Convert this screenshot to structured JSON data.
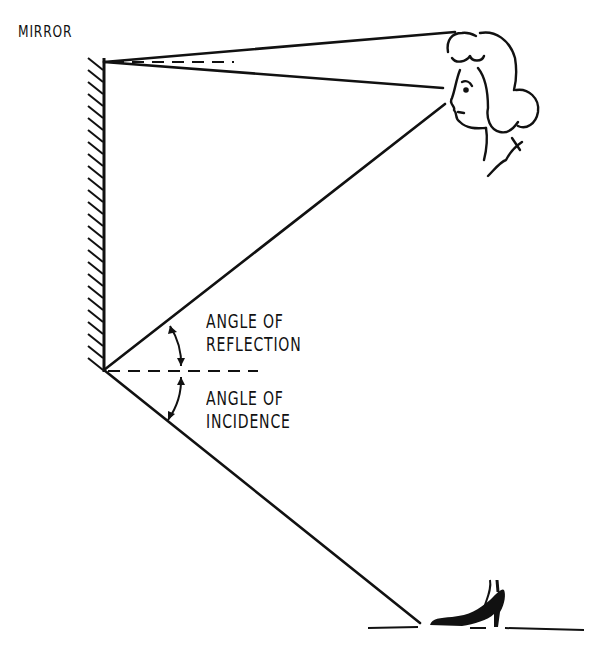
{
  "diagram": {
    "labels": {
      "mirror": "MIRROR",
      "reflection_line1": "ANGLE OF",
      "reflection_line2": "REFLECTION",
      "incidence_line1": "ANGLE OF",
      "incidence_line2": "INCIDENCE"
    },
    "colors": {
      "ink": "#111111",
      "background": "#ffffff"
    },
    "elements": [
      "mirror-with-hatching",
      "woman-head-profile",
      "high-heel-shoe",
      "ray-lines",
      "normal-dashed-lines",
      "angle-arrows"
    ]
  }
}
